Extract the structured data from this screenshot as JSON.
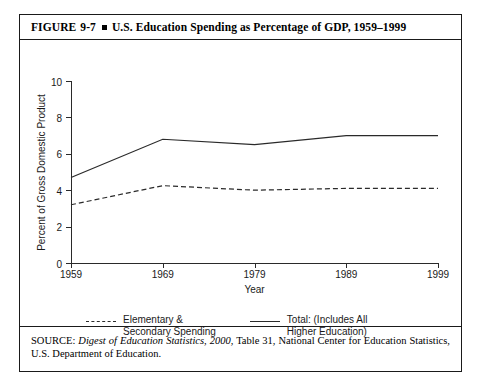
{
  "figure": {
    "label": "FIGURE",
    "number": "9-7",
    "title": "U.S. Education Spending as Percentage of GDP, 1959–1999"
  },
  "source": {
    "prefix": "SOURCE: ",
    "italic_1": "Digest of Education Statistics, 2000",
    "rest": ", Table 31, National Center for Education Statistics, U.S. Department of Education."
  },
  "legend": {
    "items": [
      {
        "label": "Elementary &\nSecondary Spending",
        "style": "dashed"
      },
      {
        "label": "Total: (Includes All\nHigher Education)",
        "style": "solid"
      }
    ]
  },
  "chart_data": {
    "type": "line",
    "title": "U.S. Education Spending as Percentage of GDP, 1959–1999",
    "xlabel": "Year",
    "ylabel": "Percent of Gross Domestic Product",
    "x": [
      1959,
      1969,
      1979,
      1989,
      1999
    ],
    "xtick_labels": [
      "1959",
      "1969",
      "1979",
      "1989",
      "1999"
    ],
    "ytick_labels": [
      "0",
      "2",
      "4",
      "6",
      "8",
      "10"
    ],
    "yticks": [
      0,
      2,
      4,
      6,
      8,
      10
    ],
    "ylim": [
      0,
      10
    ],
    "xlim": [
      1959,
      1999
    ],
    "grid": false,
    "legend_position": "below-axes",
    "series": [
      {
        "name": "Total: (Includes All Higher Education)",
        "style": "solid",
        "color": "#2a2a2a",
        "values": [
          4.7,
          6.8,
          6.5,
          7.0,
          7.0
        ]
      },
      {
        "name": "Elementary & Secondary Spending",
        "style": "dashed",
        "color": "#2a2a2a",
        "values": [
          3.2,
          4.25,
          4.0,
          4.1,
          4.1
        ]
      }
    ]
  }
}
